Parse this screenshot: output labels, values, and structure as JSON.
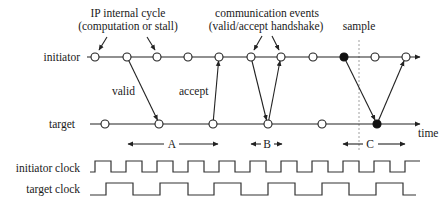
{
  "diagram": {
    "rows": {
      "initiator": "initiator",
      "target": "target",
      "initiator_clock": "initiator clock",
      "target_clock": "target clock"
    },
    "annotations": {
      "ip_cycle_line1": "IP internal cycle",
      "ip_cycle_line2": "(computation or stall)",
      "comm_line1": "communication events",
      "comm_line2": "(valid/accept handshake)",
      "sample": "sample",
      "valid": "valid",
      "accept": "accept",
      "time": "time"
    },
    "intervals": {
      "a": "A",
      "b": "B",
      "c": "C"
    },
    "initiator_nodes": [
      {
        "x": 95,
        "filled": false
      },
      {
        "x": 127,
        "filled": false
      },
      {
        "x": 157,
        "filled": false
      },
      {
        "x": 188,
        "filled": false
      },
      {
        "x": 219,
        "filled": false
      },
      {
        "x": 251,
        "filled": false
      },
      {
        "x": 281,
        "filled": false
      },
      {
        "x": 313,
        "filled": false
      },
      {
        "x": 344,
        "filled": true
      },
      {
        "x": 375,
        "filled": false
      },
      {
        "x": 406,
        "filled": false
      }
    ],
    "target_nodes": [
      {
        "x": 105,
        "filled": false
      },
      {
        "x": 159,
        "filled": false
      },
      {
        "x": 213,
        "filled": false
      },
      {
        "x": 268,
        "filled": false
      },
      {
        "x": 322,
        "filled": false
      },
      {
        "x": 377,
        "filled": true
      }
    ],
    "colors": {
      "ink": "#222222",
      "filled_node": "#111111",
      "dashed_marker": "#888888"
    }
  }
}
